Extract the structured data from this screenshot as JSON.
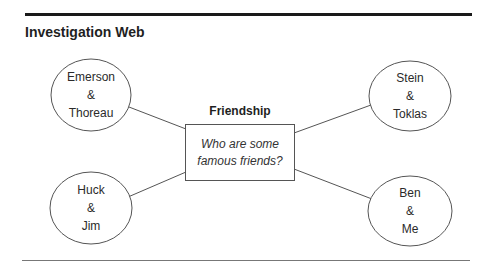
{
  "title": "Investigation Web",
  "center": {
    "heading": "Friendship",
    "question_line1": "Who are some",
    "question_line2": "famous friends?"
  },
  "nodes": [
    {
      "position": "top-left",
      "line1": "Emerson",
      "line2": "&",
      "line3": "Thoreau"
    },
    {
      "position": "top-right",
      "line1": "Stein",
      "line2": "&",
      "line3": "Toklas"
    },
    {
      "position": "bottom-left",
      "line1": "Huck",
      "line2": "&",
      "line3": "Jim"
    },
    {
      "position": "bottom-right",
      "line1": "Ben",
      "line2": "&",
      "line3": "Me"
    }
  ],
  "colors": {
    "stroke": "#555555",
    "rule": "#1a1a1a",
    "text": "#222222"
  }
}
